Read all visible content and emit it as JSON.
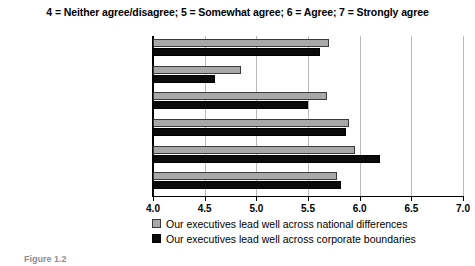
{
  "chart_data": {
    "type": "bar",
    "orientation": "horizontal",
    "title": "4 = Neither agree/disagree; 5 = Somewhat agree; 6 = Agree; 7 = Strongly agree",
    "xlabel": "",
    "ylabel": "",
    "xlim": [
      4.0,
      7.0
    ],
    "xticks": [
      "4.0",
      "4.5",
      "5.0",
      "5.5",
      "6.0",
      "6.5",
      "7.0"
    ],
    "xtick_values": [
      4.0,
      4.5,
      5.0,
      5.5,
      6.0,
      6.5,
      7.0
    ],
    "grid": true,
    "legend_position": "bottom-left",
    "categories": [
      "UK and Ireland",
      "Continental Europe",
      "Pacific Rim and Australasia",
      "China",
      "India",
      "US and Canada"
    ],
    "series": [
      {
        "name": "Our executives lead well across national differences",
        "color": "#a8a8a8",
        "values": [
          5.7,
          4.85,
          5.68,
          5.9,
          5.95,
          5.78
        ]
      },
      {
        "name": "Our executives lead well across corporate boundaries",
        "color": "#0a0a0a",
        "values": [
          5.62,
          4.6,
          5.5,
          5.87,
          6.2,
          5.82
        ]
      }
    ]
  },
  "caption": "Figure 1.2"
}
